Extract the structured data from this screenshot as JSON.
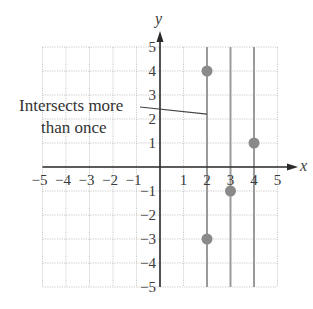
{
  "chart_data": {
    "type": "scatter",
    "title": "",
    "xlabel": "x",
    "ylabel": "y",
    "xlim": [
      -5,
      5
    ],
    "ylim": [
      -5,
      5
    ],
    "grid": true,
    "x_ticks": [
      -5,
      -4,
      -3,
      -2,
      -1,
      1,
      2,
      3,
      4,
      5
    ],
    "y_ticks": [
      5,
      4,
      3,
      2,
      1,
      -1,
      -2,
      -3,
      -4,
      -5
    ],
    "x_tick_labels": [
      "−5",
      "−4",
      "−3",
      "−2",
      "−1",
      "1",
      "2",
      "3",
      "4",
      "5"
    ],
    "y_tick_labels": [
      "5",
      "4",
      "3",
      "2",
      "1",
      "−1",
      "−2",
      "−3",
      "−4",
      "−5"
    ],
    "points": [
      {
        "x": 2,
        "y": 4
      },
      {
        "x": 4,
        "y": 1
      },
      {
        "x": 3,
        "y": -1
      },
      {
        "x": 2,
        "y": -3
      }
    ],
    "vertical_lines": [
      2,
      3,
      4
    ],
    "annotation": {
      "lines": [
        "Intersects more",
        "than once"
      ],
      "points_to": {
        "x": 2,
        "y": 2.2
      }
    },
    "colors": {
      "points": "#8a8a8a",
      "vertical_lines": "#9a9a9a",
      "axes": "#2a2a2a",
      "grid": "#c8c8c8"
    }
  }
}
